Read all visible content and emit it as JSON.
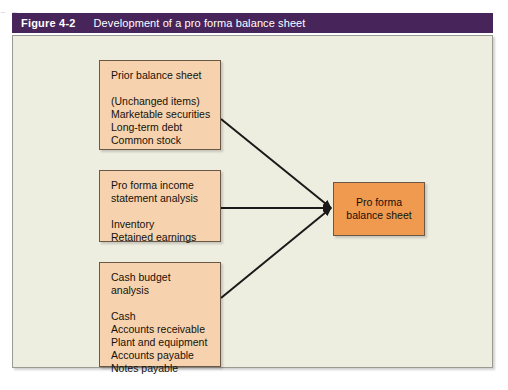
{
  "scan_remnant": "p      g",
  "caption": {
    "number": "Figure 4-2",
    "title": "Development of a pro forma balance sheet"
  },
  "colors": {
    "caption_bar": "#472459",
    "panel_background": "#edede0",
    "panel_border": "#9a9a92",
    "source_box_fill": "#f6d3ae",
    "target_box_fill": "#ef9a4e",
    "box_border": "#6b5746",
    "connector": "#1a1a1a",
    "text": "#15110c"
  },
  "diagram": {
    "type": "flow",
    "direction": "left-to-right converging",
    "nodes": [
      {
        "id": "prior-balance-sheet",
        "role": "source",
        "heading": "Prior balance sheet",
        "items": [
          "(Unchanged items)",
          "Marketable securities",
          "Long-term debt",
          "Common stock"
        ]
      },
      {
        "id": "pro-forma-income-statement",
        "role": "source",
        "heading_line1": "Pro forma income",
        "heading_line2": "statement analysis",
        "items": [
          "Inventory",
          "Retained earnings"
        ]
      },
      {
        "id": "cash-budget-analysis",
        "role": "source",
        "heading_line1": "Cash budget",
        "heading_line2": "analysis",
        "items": [
          "Cash",
          "Accounts receivable",
          "Plant and equipment",
          "Accounts payable",
          "Notes payable"
        ]
      },
      {
        "id": "pro-forma-balance-sheet",
        "role": "target",
        "heading_line1": "Pro forma",
        "heading_line2": "balance sheet"
      }
    ],
    "edges": [
      {
        "from": "prior-balance-sheet",
        "to": "pro-forma-balance-sheet",
        "arrow": true
      },
      {
        "from": "pro-forma-income-statement",
        "to": "pro-forma-balance-sheet",
        "arrow": true
      },
      {
        "from": "cash-budget-analysis",
        "to": "pro-forma-balance-sheet",
        "arrow": true
      }
    ]
  }
}
